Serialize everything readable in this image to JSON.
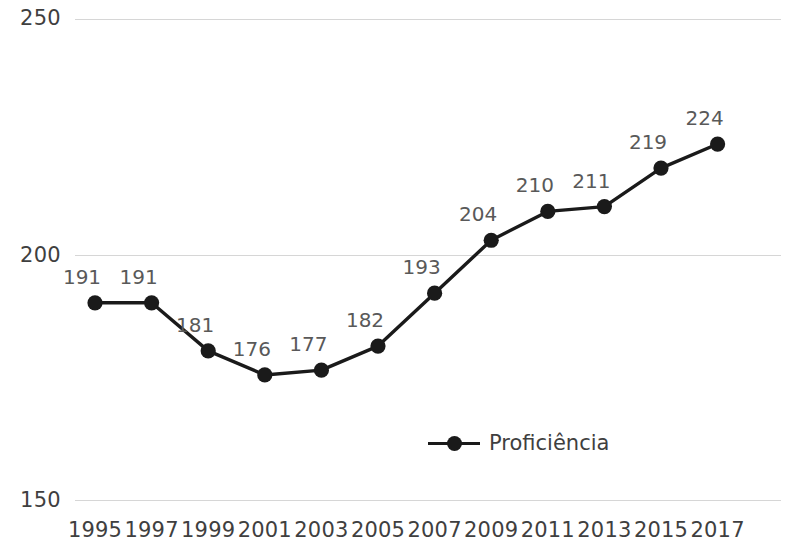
{
  "chart_data": {
    "type": "line",
    "title": "",
    "subtitle": "",
    "xlabel": "",
    "ylabel": "",
    "categories": [
      "1995",
      "1997",
      "1999",
      "2001",
      "2003",
      "2005",
      "2007",
      "2009",
      "2011",
      "2013",
      "2015",
      "2017"
    ],
    "series": [
      {
        "name": "Proficiência",
        "values": [
          191,
          191,
          181,
          176,
          177,
          182,
          193,
          204,
          210,
          211,
          219,
          224
        ],
        "color": "#1a1a1a",
        "marker": "circle",
        "show_data_labels": true
      }
    ],
    "ylim": [
      150,
      250
    ],
    "yticks": [
      150,
      200,
      250
    ],
    "ytick_labels": [
      "150",
      "200",
      "250"
    ],
    "grid": true,
    "grid_color": "#d6d6d6",
    "legend": true,
    "legend_position": "bottom-center",
    "data_label_color": "#595959",
    "axis_label_color": "#3f3f3f"
  },
  "legend": {
    "entries": [
      {
        "label": "Proficiência",
        "color": "#1a1a1a"
      }
    ]
  }
}
